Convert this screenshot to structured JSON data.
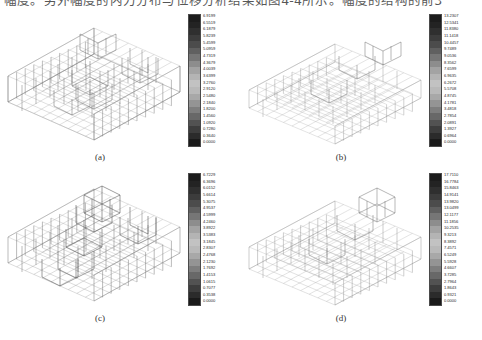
{
  "page": {
    "header_text_partial": "幅度。另外幅度的内力分布与位移分析结果如图4-4所示。幅度的结构的前3",
    "background_color": "#ffffff",
    "ink_color": "#000000"
  },
  "figure": {
    "panels": [
      {
        "id": "a",
        "caption": "(a)",
        "model": "3d-frame-wireframe",
        "colorbar": {
          "type": "grayscale-contour",
          "units": "",
          "labels": [
            "6.9199",
            "6.5519",
            "6.1879",
            "5.8239",
            "5.4599",
            "5.0959",
            "4.7319",
            "4.3679",
            "4.0039",
            "3.6399",
            "3.2760",
            "2.9120",
            "2.5480",
            "2.1840",
            "1.8200",
            "1.4560",
            "1.0920",
            "0.7280",
            "0.3640",
            "0.0000"
          ],
          "max": "6.9199",
          "min": "0.0000"
        }
      },
      {
        "id": "b",
        "caption": "(b)",
        "model": "3d-frame-wireframe",
        "colorbar": {
          "type": "grayscale-contour",
          "units": "",
          "labels": [
            "13.2307",
            "12.5341",
            "11.8380",
            "11.1418",
            "10.4457",
            "9.7489",
            "9.0536",
            "8.3562",
            "7.6599",
            "6.9635",
            "6.2672",
            "5.5708",
            "4.8745",
            "4.1781",
            "3.4818",
            "2.7854",
            "2.0891",
            "1.3927",
            "0.6964",
            "0.0000"
          ],
          "max": "13.2307",
          "min": "0.0000"
        }
      },
      {
        "id": "c",
        "caption": "(c)",
        "model": "3d-frame-wireframe",
        "colorbar": {
          "type": "grayscale-contour",
          "units": "",
          "labels": [
            "6.7229",
            "6.3696",
            "6.0152",
            "5.6614",
            "5.3075",
            "4.9537",
            "4.5999",
            "4.2460",
            "3.8922",
            "3.5383",
            "3.1845",
            "2.8307",
            "2.4768",
            "2.1230",
            "1.7692",
            "1.4153",
            "1.0615",
            "0.7077",
            "0.3538",
            "0.0000"
          ],
          "max": "6.7229",
          "min": "0.0000"
        }
      },
      {
        "id": "d",
        "caption": "(d)",
        "model": "3d-frame-wireframe",
        "colorbar": {
          "type": "grayscale-contour",
          "units": "",
          "labels": [
            "17.7110",
            "16.7784",
            "15.8463",
            "14.9141",
            "13.9820",
            "13.0499",
            "12.1177",
            "11.1856",
            "10.2535",
            "9.3213",
            "8.3892",
            "7.4571",
            "6.5249",
            "5.5928",
            "4.6607",
            "3.7285",
            "2.7964",
            "1.8643",
            "0.9321",
            "0.0000"
          ],
          "max": "17.7110",
          "min": "0.0000"
        }
      }
    ],
    "colorbar_swatch_colors": [
      "#1c1c1c",
      "#232323",
      "#2f2f2f",
      "#3c3c3c",
      "#4c4c4c",
      "#606060",
      "#767676",
      "#8d8d8d",
      "#a3a3a3",
      "#b4b4b4",
      "#c2c2c2",
      "#b9b9b9",
      "#a8a8a8",
      "#949494",
      "#7e7e7e",
      "#686868",
      "#525252",
      "#3d3d3d",
      "#2b2b2b",
      "#1a1a1a"
    ]
  }
}
